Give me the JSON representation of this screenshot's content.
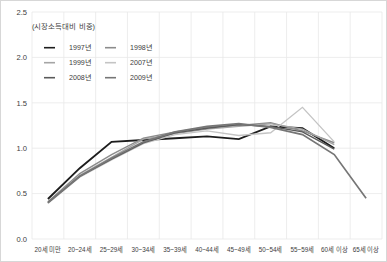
{
  "subtitle": "(시장소득대비 비중)",
  "legend": {
    "position": "top-left",
    "items": [
      {
        "label": "1997년",
        "color": "#1d1d1d"
      },
      {
        "label": "1998년",
        "color": "#8c8c8c"
      },
      {
        "label": "1999년",
        "color": "#a5a5a5"
      },
      {
        "label": "2007년",
        "color": "#c4c4c4"
      },
      {
        "label": "2008년",
        "color": "#5a5a5a"
      },
      {
        "label": "2009년",
        "color": "#767676"
      }
    ]
  },
  "chart_data": {
    "type": "line",
    "title": "",
    "subtitle": "(시장소득대비 비중)",
    "xlabel": "",
    "ylabel": "",
    "grid": true,
    "ylim": [
      0.0,
      2.5
    ],
    "yticks": [
      "0.0",
      "0.5",
      "1.0",
      "1.5",
      "2.0",
      "2.5"
    ],
    "ytick_values": [
      0.0,
      0.5,
      1.0,
      1.5,
      2.0,
      2.5
    ],
    "categories": [
      "20세 미만",
      "20~24세",
      "25~29세",
      "30~34세",
      "35~39세",
      "40~44세",
      "45~49세",
      "50~54세",
      "55~59세",
      "60세 이상",
      "65세 이상"
    ],
    "series": [
      {
        "name": "1997년",
        "color": "#1d1d1d",
        "width": 1.9,
        "values": [
          0.44,
          0.78,
          1.07,
          1.09,
          1.11,
          1.13,
          1.1,
          1.24,
          1.22,
          1.0,
          null
        ]
      },
      {
        "name": "1998년",
        "color": "#8c8c8c",
        "width": 1.4,
        "values": [
          0.41,
          0.72,
          0.93,
          1.11,
          1.18,
          1.23,
          1.25,
          1.28,
          1.19,
          1.06,
          null
        ]
      },
      {
        "name": "1999년",
        "color": "#a5a5a5",
        "width": 1.4,
        "values": [
          0.4,
          0.7,
          0.9,
          1.1,
          1.16,
          1.21,
          1.24,
          1.27,
          1.21,
          1.04,
          null
        ]
      },
      {
        "name": "2007년",
        "color": "#c4c4c4",
        "width": 1.3,
        "values": [
          0.39,
          0.68,
          0.87,
          1.05,
          1.15,
          1.19,
          1.14,
          1.17,
          1.45,
          1.07,
          null
        ]
      },
      {
        "name": "2008년",
        "color": "#5a5a5a",
        "width": 1.5,
        "values": [
          0.4,
          0.69,
          0.88,
          1.06,
          1.17,
          1.22,
          1.26,
          1.24,
          1.18,
          0.99,
          null
        ]
      },
      {
        "name": "2009년",
        "color": "#767676",
        "width": 1.7,
        "values": [
          0.4,
          0.69,
          0.89,
          1.07,
          1.18,
          1.24,
          1.27,
          1.23,
          1.15,
          0.93,
          0.45
        ]
      }
    ]
  }
}
